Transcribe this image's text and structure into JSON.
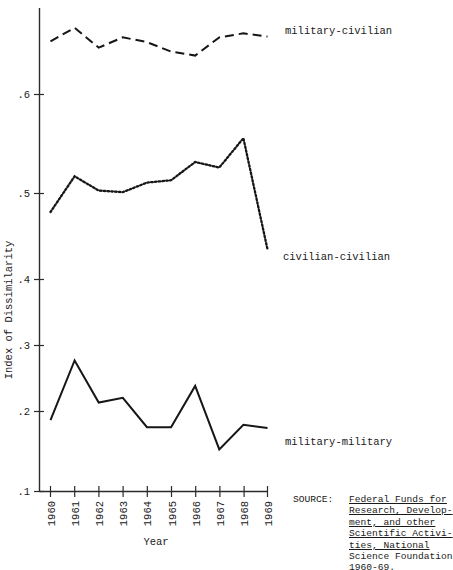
{
  "chart_data": {
    "type": "line",
    "title": "",
    "xlabel": "Year",
    "ylabel": "Index of Dissimilarity",
    "x": [
      1960,
      1961,
      1962,
      1963,
      1964,
      1965,
      1966,
      1967,
      1968,
      1969
    ],
    "categories": [
      "1960",
      "1961",
      "1962",
      "1963",
      "1964",
      "1965",
      "1966",
      "1967",
      "1968",
      "1969"
    ],
    "xlim": [
      1960,
      1969
    ],
    "ylim": [
      0.1,
      0.7
    ],
    "yticks": [
      0.1,
      0.2,
      0.3,
      0.4,
      0.5,
      0.6
    ],
    "ytick_labels": [
      ".1",
      ".2",
      ".3",
      ".4",
      ".5",
      ".6"
    ],
    "grid": false,
    "legend_position": "inline-right-of-series",
    "series": [
      {
        "name": "military-civilian",
        "style": "dashed",
        "values": [
          0.667,
          0.684,
          0.659,
          0.672,
          0.666,
          0.654,
          0.649,
          0.672,
          0.677,
          0.673
        ]
      },
      {
        "name": "civilian-civilian",
        "style": "dotted",
        "values": [
          0.452,
          0.497,
          0.479,
          0.477,
          0.489,
          0.492,
          0.515,
          0.508,
          0.545,
          0.405
        ]
      },
      {
        "name": "military-military",
        "style": "solid",
        "values": [
          0.19,
          0.265,
          0.212,
          0.218,
          0.181,
          0.181,
          0.233,
          0.153,
          0.184,
          0.18
        ]
      }
    ]
  },
  "axes": {
    "y_axis_title": "Index of Dissimilarity",
    "x_axis_title": "Year",
    "y_tick_labels": [
      ".6",
      ".5",
      ".4",
      ".3",
      ".2",
      ".1"
    ],
    "x_tick_labels": [
      "1960",
      "1961",
      "1962",
      "1963",
      "1964",
      "1965",
      "1966",
      "1967",
      "1968",
      "1969"
    ]
  },
  "series_labels": {
    "military_civilian": "military-civilian",
    "civilian_civilian": "civilian-civilian",
    "military_military": "military-military"
  },
  "source": {
    "label": "SOURCE:",
    "lines": [
      "Federal Funds for",
      "Research, Develop-",
      "ment, and other",
      "Scientific Activi-",
      "ties, National",
      "Science Foundation",
      "1960-69."
    ],
    "underlined_line_count": 5
  },
  "colors": {
    "ink": "#161616",
    "axis": "#2b2b2b",
    "background": "#ffffff"
  }
}
